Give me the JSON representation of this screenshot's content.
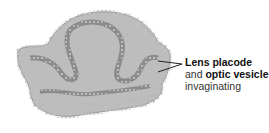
{
  "figure": {
    "colors": {
      "tissue_fill": "#b9b9b9",
      "tissue_dark": "#8a8a8a",
      "cells": "#e0e0e0",
      "leader": "#222222",
      "text": "#333333"
    }
  },
  "label": {
    "line1_bold": "Lens placode",
    "line2_prefix": "and ",
    "line2_bold": "optic vesicle",
    "line3": "invaginating"
  }
}
